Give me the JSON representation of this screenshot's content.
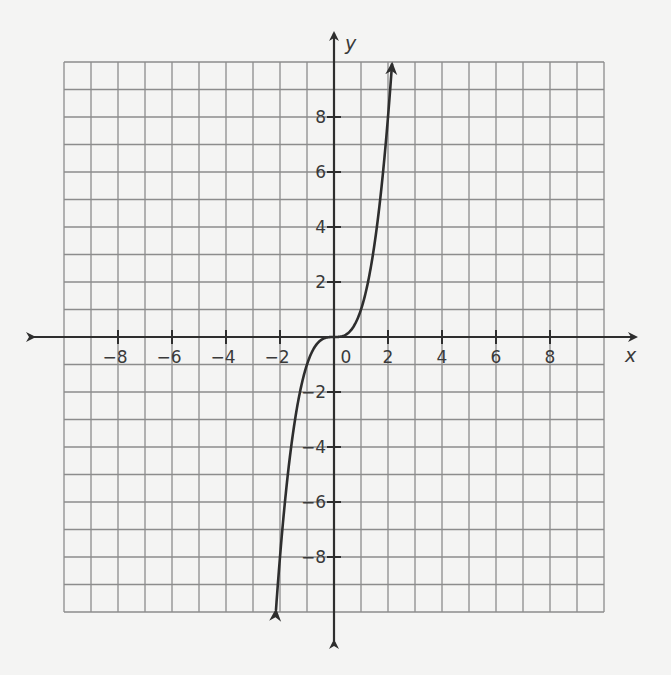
{
  "chart_data": {
    "type": "line",
    "title": "",
    "function": "y = x^3",
    "xlabel": "x",
    "ylabel": "y",
    "xlim": [
      -10,
      10
    ],
    "ylim": [
      -10,
      10
    ],
    "grid": true,
    "grid_step": 1,
    "x_ticks": [
      -8,
      -6,
      -4,
      -2,
      0,
      2,
      4,
      6,
      8
    ],
    "y_ticks": [
      -8,
      -6,
      -4,
      -2,
      2,
      4,
      6,
      8
    ],
    "x_tick_labels": [
      "−8",
      "−6",
      "−4",
      "−2",
      "0",
      "2",
      "4",
      "6",
      "8"
    ],
    "y_tick_labels": [
      "−8",
      "−6",
      "−4",
      "−2",
      "2",
      "4",
      "6",
      "8"
    ],
    "origin_label": "0",
    "series": [
      {
        "name": "y = x^3",
        "x": [
          -2.15,
          -2,
          -1.5,
          -1,
          -0.5,
          0,
          0.5,
          1,
          1.5,
          2,
          2.15
        ],
        "y": [
          -9.94,
          -8,
          -3.375,
          -1,
          -0.125,
          0,
          0.125,
          1,
          3.375,
          8,
          9.94
        ],
        "arrows": "both-ends"
      }
    ],
    "colors": {
      "grid": "#8c8c8c",
      "axis": "#2e2e2e",
      "curve": "#2e2e2e",
      "background": "#f4f4f3"
    }
  }
}
